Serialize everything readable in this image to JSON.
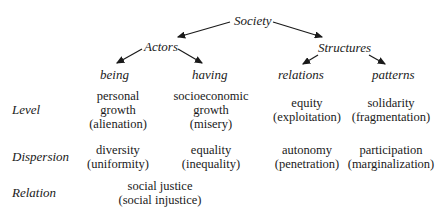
{
  "tree": {
    "root": "Society",
    "branches": [
      {
        "label": "Actors",
        "children": [
          "being",
          "having"
        ]
      },
      {
        "label": "Structures",
        "children": [
          "relations",
          "patterns"
        ]
      }
    ]
  },
  "rows": [
    {
      "label": "Level",
      "cells": [
        {
          "lines": [
            "personal",
            "growth",
            "(alienation)"
          ]
        },
        {
          "lines": [
            "socioeconomic",
            "growth",
            "(misery)"
          ]
        },
        {
          "lines": [
            "equity",
            "(exploitation)"
          ]
        },
        {
          "lines": [
            "solidarity",
            "(fragmentation)"
          ]
        }
      ]
    },
    {
      "label": "Dispersion",
      "cells": [
        {
          "lines": [
            "diversity",
            "(uniformity)"
          ]
        },
        {
          "lines": [
            "equality",
            "(inequality)"
          ]
        },
        {
          "lines": [
            "autonomy",
            "(penetration)"
          ]
        },
        {
          "lines": [
            "participation",
            "(marginalization)"
          ]
        }
      ]
    },
    {
      "label": "Relation",
      "cells": [
        {
          "lines": [
            "social justice",
            "(social injustice)"
          ]
        }
      ]
    }
  ],
  "colors": {
    "text": "#1a1a1a",
    "background": "#ffffff"
  }
}
